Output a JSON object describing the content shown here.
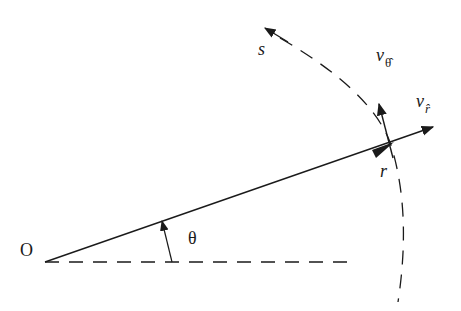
{
  "diagram": {
    "type": "polar-coordinates-velocity-components",
    "labels": {
      "origin": "O",
      "angle": "θ",
      "radius": "r",
      "arc_length": "s",
      "v_theta_base": "v",
      "v_theta_sub": "θ̂",
      "v_r_base": "v",
      "v_r_sub": "r̂"
    },
    "colors": {
      "stroke": "#1a1a1a",
      "background": "#ffffff"
    }
  }
}
